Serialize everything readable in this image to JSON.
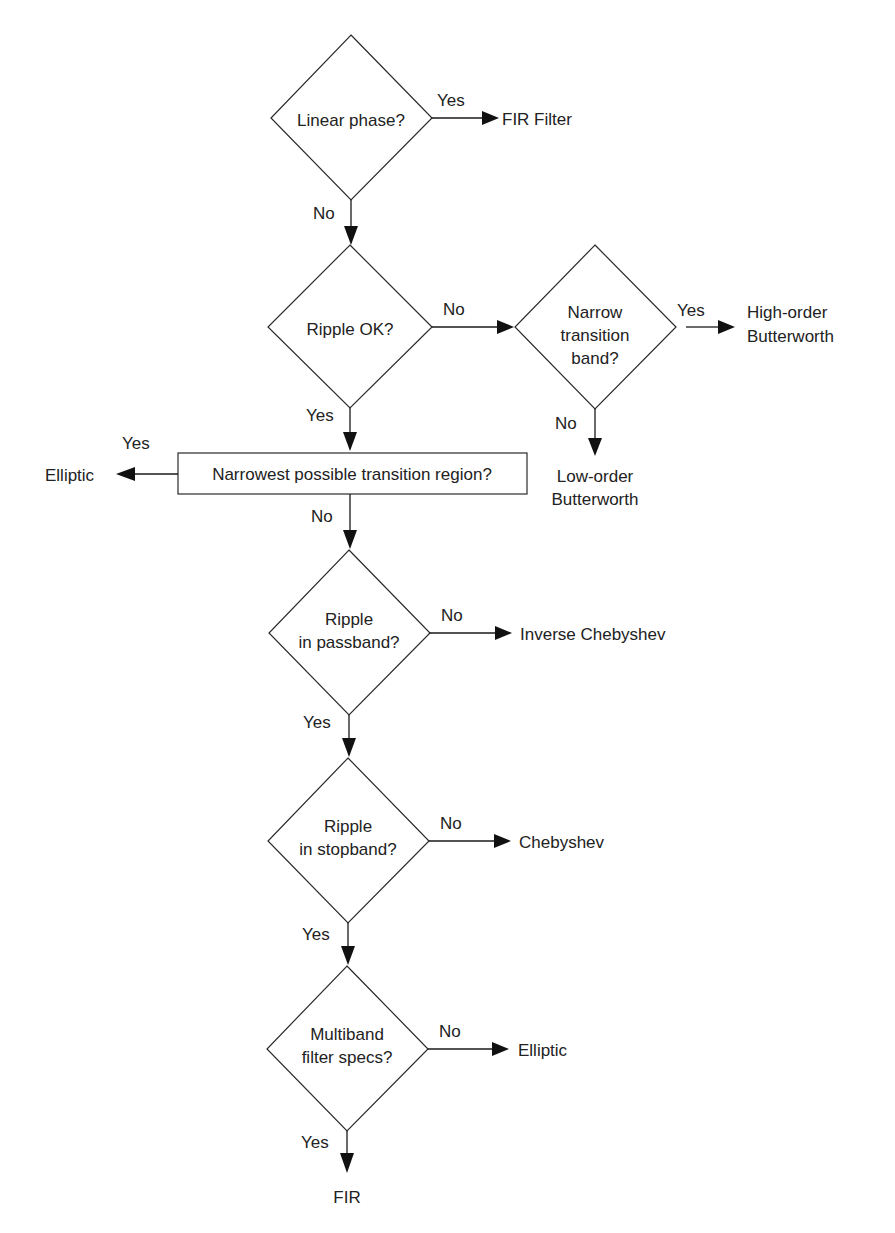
{
  "diagram": {
    "type": "flowchart",
    "title": "",
    "decisions": [
      {
        "id": "d1",
        "lines": [
          "Linear phase?"
        ]
      },
      {
        "id": "d2",
        "lines": [
          "Ripple OK?"
        ]
      },
      {
        "id": "d3",
        "lines": [
          "Narrow",
          "transition",
          "band?"
        ]
      },
      {
        "id": "d4",
        "lines": [
          "Narrowest possible transition region?"
        ]
      },
      {
        "id": "d5",
        "lines": [
          "Ripple",
          "in passband?"
        ]
      },
      {
        "id": "d6",
        "lines": [
          "Ripple",
          "in stopband?"
        ]
      },
      {
        "id": "d7",
        "lines": [
          "Multiband",
          "filter specs?"
        ]
      }
    ],
    "outcomes": [
      {
        "id": "o1",
        "lines": [
          "FIR Filter"
        ]
      },
      {
        "id": "o2",
        "lines": [
          "High-order",
          "Butterworth"
        ]
      },
      {
        "id": "o3",
        "lines": [
          "Low-order",
          "Butterworth"
        ]
      },
      {
        "id": "o4",
        "lines": [
          "Elliptic"
        ]
      },
      {
        "id": "o5",
        "lines": [
          "Inverse Chebyshev"
        ]
      },
      {
        "id": "o6",
        "lines": [
          "Chebyshev"
        ]
      },
      {
        "id": "o7",
        "lines": [
          "Elliptic"
        ]
      },
      {
        "id": "o8",
        "lines": [
          "FIR"
        ]
      }
    ],
    "edges": [
      {
        "from": "d1",
        "to": "o1",
        "label": "Yes"
      },
      {
        "from": "d1",
        "to": "d2",
        "label": "No"
      },
      {
        "from": "d2",
        "to": "d3",
        "label": "No"
      },
      {
        "from": "d3",
        "to": "o2",
        "label": "Yes"
      },
      {
        "from": "d3",
        "to": "o3",
        "label": "No"
      },
      {
        "from": "d2",
        "to": "d4",
        "label": "Yes"
      },
      {
        "from": "d4",
        "to": "o4",
        "label": "Yes"
      },
      {
        "from": "d4",
        "to": "d5",
        "label": "No"
      },
      {
        "from": "d5",
        "to": "o5",
        "label": "No"
      },
      {
        "from": "d5",
        "to": "d6",
        "label": "Yes"
      },
      {
        "from": "d6",
        "to": "o6",
        "label": "No"
      },
      {
        "from": "d6",
        "to": "d7",
        "label": "Yes"
      },
      {
        "from": "d7",
        "to": "o7",
        "label": "No"
      },
      {
        "from": "d7",
        "to": "o8",
        "label": "Yes"
      }
    ]
  }
}
